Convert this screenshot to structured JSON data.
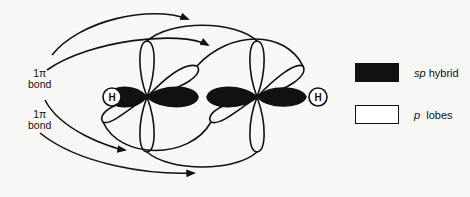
{
  "diagram": {
    "atoms": [
      {
        "symbol": "H",
        "position": "left"
      },
      {
        "symbol": "C",
        "position": "left-center"
      },
      {
        "symbol": "C",
        "position": "right-center"
      },
      {
        "symbol": "H",
        "position": "right"
      }
    ],
    "bond_labels": [
      {
        "line1": "1π",
        "line2": "bond"
      },
      {
        "line1": "1π",
        "line2": "bond"
      }
    ],
    "h_label": "H"
  },
  "legend": {
    "items": [
      {
        "prefix": "sp",
        "suffix": " hybrid",
        "swatch": "#111111"
      },
      {
        "prefix": "p",
        "suffix": "  lobes",
        "swatch": "#ffffff"
      }
    ]
  },
  "colors": {
    "ink": "#111111",
    "background": "#f7f7f5"
  }
}
